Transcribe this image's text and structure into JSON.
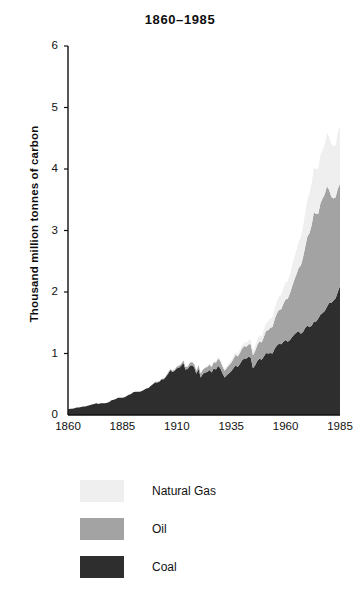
{
  "title": "1860–1985",
  "axes": {
    "ylabel": "Thousand million tonnes of carbon",
    "yticks": [
      "0",
      "1",
      "2",
      "3",
      "4",
      "5",
      "6"
    ],
    "xticks": [
      "1860",
      "1885",
      "1910",
      "1935",
      "1960",
      "1985"
    ]
  },
  "legend": {
    "items": [
      {
        "label": "Natural Gas",
        "color": "#efefef"
      },
      {
        "label": "Oil",
        "color": "#a3a3a3"
      },
      {
        "label": "Coal",
        "color": "#2e2e2e"
      }
    ]
  },
  "colors": {
    "coal": "#2e2e2e",
    "oil": "#a3a3a3",
    "gas": "#efefef",
    "axis": "#111111",
    "background": "#ffffff"
  },
  "chart_data": {
    "type": "area",
    "stacked": true,
    "title": "1860–1985",
    "xlabel": "",
    "ylabel": "Thousand million tonnes of carbon",
    "xlim": [
      1860,
      1986
    ],
    "ylim": [
      0,
      6
    ],
    "grid": false,
    "legend_position": "below",
    "units": "thousand million tonnes of carbon",
    "x": [
      1860,
      1861,
      1862,
      1863,
      1864,
      1865,
      1866,
      1867,
      1868,
      1869,
      1870,
      1871,
      1872,
      1873,
      1874,
      1875,
      1876,
      1877,
      1878,
      1879,
      1880,
      1881,
      1882,
      1883,
      1884,
      1885,
      1886,
      1887,
      1888,
      1889,
      1890,
      1891,
      1892,
      1893,
      1894,
      1895,
      1896,
      1897,
      1898,
      1899,
      1900,
      1901,
      1902,
      1903,
      1904,
      1905,
      1906,
      1907,
      1908,
      1909,
      1910,
      1911,
      1912,
      1913,
      1914,
      1915,
      1916,
      1917,
      1918,
      1919,
      1920,
      1921,
      1922,
      1923,
      1924,
      1925,
      1926,
      1927,
      1928,
      1929,
      1930,
      1931,
      1932,
      1933,
      1934,
      1935,
      1936,
      1937,
      1938,
      1939,
      1940,
      1941,
      1942,
      1943,
      1944,
      1945,
      1946,
      1947,
      1948,
      1949,
      1950,
      1951,
      1952,
      1953,
      1954,
      1955,
      1956,
      1957,
      1958,
      1959,
      1960,
      1961,
      1962,
      1963,
      1964,
      1965,
      1966,
      1967,
      1968,
      1969,
      1970,
      1971,
      1972,
      1973,
      1974,
      1975,
      1976,
      1977,
      1978,
      1979,
      1980,
      1981,
      1982,
      1983,
      1984,
      1985
    ],
    "series": [
      {
        "name": "Coal",
        "color": "#2e2e2e",
        "values": [
          0.09,
          0.1,
          0.1,
          0.11,
          0.12,
          0.12,
          0.13,
          0.14,
          0.14,
          0.15,
          0.16,
          0.17,
          0.18,
          0.19,
          0.18,
          0.19,
          0.19,
          0.19,
          0.2,
          0.21,
          0.24,
          0.25,
          0.26,
          0.28,
          0.28,
          0.28,
          0.29,
          0.31,
          0.33,
          0.34,
          0.37,
          0.38,
          0.38,
          0.38,
          0.39,
          0.41,
          0.43,
          0.44,
          0.47,
          0.5,
          0.53,
          0.53,
          0.54,
          0.58,
          0.58,
          0.62,
          0.67,
          0.73,
          0.7,
          0.72,
          0.76,
          0.77,
          0.8,
          0.85,
          0.74,
          0.75,
          0.8,
          0.81,
          0.78,
          0.67,
          0.75,
          0.61,
          0.67,
          0.69,
          0.7,
          0.73,
          0.69,
          0.76,
          0.74,
          0.8,
          0.76,
          0.68,
          0.61,
          0.65,
          0.68,
          0.71,
          0.76,
          0.81,
          0.78,
          0.83,
          0.89,
          0.92,
          0.92,
          0.95,
          0.93,
          0.76,
          0.81,
          0.88,
          0.92,
          0.9,
          0.95,
          1.01,
          1.0,
          1.01,
          1.0,
          1.08,
          1.13,
          1.16,
          1.15,
          1.19,
          1.22,
          1.19,
          1.22,
          1.27,
          1.31,
          1.34,
          1.36,
          1.32,
          1.35,
          1.42,
          1.45,
          1.43,
          1.45,
          1.52,
          1.52,
          1.57,
          1.63,
          1.66,
          1.69,
          1.76,
          1.82,
          1.82,
          1.86,
          1.9,
          2.0,
          2.1
        ]
      },
      {
        "name": "Oil",
        "color": "#a3a3a3",
        "values": [
          0.0,
          0.0,
          0.0,
          0.0,
          0.0,
          0.0,
          0.0,
          0.0,
          0.0,
          0.0,
          0.0,
          0.0,
          0.0,
          0.0,
          0.0,
          0.0,
          0.0,
          0.0,
          0.0,
          0.0,
          0.0,
          0.0,
          0.0,
          0.0,
          0.0,
          0.0,
          0.0,
          0.0,
          0.0,
          0.0,
          0.0,
          0.0,
          0.0,
          0.0,
          0.0,
          0.0,
          0.0,
          0.0,
          0.0,
          0.0,
          0.01,
          0.01,
          0.01,
          0.01,
          0.01,
          0.01,
          0.02,
          0.02,
          0.02,
          0.02,
          0.03,
          0.03,
          0.03,
          0.04,
          0.04,
          0.04,
          0.05,
          0.05,
          0.05,
          0.05,
          0.06,
          0.06,
          0.07,
          0.08,
          0.08,
          0.09,
          0.09,
          0.1,
          0.11,
          0.12,
          0.12,
          0.11,
          0.11,
          0.12,
          0.13,
          0.14,
          0.15,
          0.17,
          0.17,
          0.18,
          0.19,
          0.2,
          0.19,
          0.2,
          0.22,
          0.21,
          0.23,
          0.26,
          0.28,
          0.28,
          0.32,
          0.36,
          0.38,
          0.41,
          0.43,
          0.48,
          0.52,
          0.55,
          0.57,
          0.62,
          0.66,
          0.7,
          0.76,
          0.82,
          0.89,
          0.95,
          1.03,
          1.11,
          1.21,
          1.31,
          1.45,
          1.53,
          1.64,
          1.78,
          1.75,
          1.7,
          1.81,
          1.86,
          1.9,
          1.96,
          1.84,
          1.73,
          1.66,
          1.64,
          1.68,
          1.66
        ]
      },
      {
        "name": "Natural Gas",
        "color": "#efefef",
        "values": [
          0.0,
          0.0,
          0.0,
          0.0,
          0.0,
          0.0,
          0.0,
          0.0,
          0.0,
          0.0,
          0.0,
          0.0,
          0.0,
          0.0,
          0.0,
          0.0,
          0.0,
          0.0,
          0.0,
          0.0,
          0.0,
          0.0,
          0.0,
          0.0,
          0.0,
          0.0,
          0.0,
          0.0,
          0.0,
          0.0,
          0.0,
          0.0,
          0.0,
          0.0,
          0.0,
          0.0,
          0.0,
          0.0,
          0.0,
          0.0,
          0.0,
          0.0,
          0.0,
          0.0,
          0.0,
          0.0,
          0.0,
          0.01,
          0.01,
          0.01,
          0.01,
          0.01,
          0.01,
          0.01,
          0.01,
          0.01,
          0.01,
          0.01,
          0.01,
          0.01,
          0.01,
          0.01,
          0.01,
          0.02,
          0.02,
          0.02,
          0.02,
          0.02,
          0.03,
          0.03,
          0.03,
          0.03,
          0.03,
          0.03,
          0.03,
          0.04,
          0.04,
          0.04,
          0.04,
          0.05,
          0.05,
          0.06,
          0.06,
          0.07,
          0.07,
          0.07,
          0.08,
          0.09,
          0.1,
          0.1,
          0.12,
          0.13,
          0.14,
          0.15,
          0.16,
          0.18,
          0.2,
          0.22,
          0.23,
          0.25,
          0.27,
          0.29,
          0.31,
          0.34,
          0.37,
          0.39,
          0.43,
          0.46,
          0.5,
          0.55,
          0.6,
          0.64,
          0.68,
          0.72,
          0.73,
          0.73,
          0.78,
          0.79,
          0.81,
          0.86,
          0.87,
          0.86,
          0.85,
          0.85,
          0.91,
          0.94
        ]
      }
    ]
  }
}
